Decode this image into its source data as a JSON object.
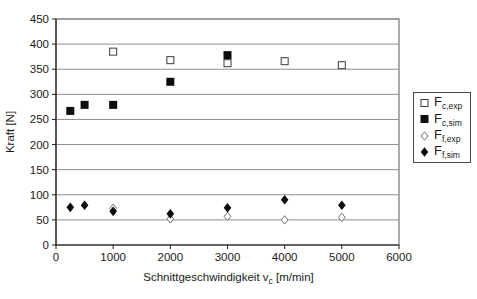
{
  "chart_data": {
    "type": "scatter",
    "title": "",
    "ylabel": "Kraft [N]",
    "xlabel": {
      "prefix": "Schnittgeschwindigkeit v",
      "sub": "c",
      "suffix": " [m/min]"
    },
    "xlim": [
      0,
      6000
    ],
    "ylim": [
      0,
      450
    ],
    "x_ticks": [
      0,
      1000,
      2000,
      3000,
      4000,
      5000,
      6000
    ],
    "y_ticks": [
      0,
      50,
      100,
      150,
      200,
      250,
      300,
      350,
      400,
      450
    ],
    "grid": "horizontal",
    "legend_position": "right-outside",
    "series": [
      {
        "name_main": "F",
        "name_sub": "c,exp",
        "marker": "square-open",
        "points": [
          [
            1000,
            385
          ],
          [
            2000,
            368
          ],
          [
            3000,
            362
          ],
          [
            4000,
            366
          ],
          [
            5000,
            358
          ]
        ]
      },
      {
        "name_main": "F",
        "name_sub": "c,sim",
        "marker": "square-filled",
        "points": [
          [
            250,
            267
          ],
          [
            500,
            279
          ],
          [
            1000,
            279
          ],
          [
            2000,
            325
          ],
          [
            3000,
            378
          ]
        ]
      },
      {
        "name_main": "F",
        "name_sub": "f,exp",
        "marker": "diamond-open",
        "points": [
          [
            1000,
            73
          ],
          [
            2000,
            52
          ],
          [
            3000,
            57
          ],
          [
            4000,
            50
          ],
          [
            5000,
            55
          ]
        ]
      },
      {
        "name_main": "F",
        "name_sub": "f,sim",
        "marker": "diamond-filled",
        "points": [
          [
            250,
            75
          ],
          [
            500,
            79
          ],
          [
            1000,
            67
          ],
          [
            2000,
            62
          ],
          [
            3000,
            74
          ],
          [
            4000,
            90
          ],
          [
            5000,
            79
          ]
        ]
      }
    ]
  },
  "colors": {
    "background": "#ffffff",
    "text": "#1a1a1a",
    "gridline": "#8f8f8f",
    "frame": "#5a5a5a",
    "axis": "#1f1f1f",
    "marker_fill": "#0d0d0d",
    "marker_open_stroke": "#3a3a3a",
    "diamond_open_stroke": "#6d6d6d"
  }
}
